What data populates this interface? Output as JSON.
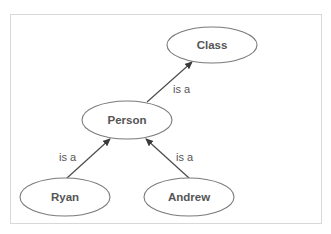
{
  "diagram": {
    "type": "class hierarchy",
    "colors": {
      "background": "#ffffff",
      "frame_border": "#d8d8d8",
      "node_stroke": "#7a7a7a",
      "node_text": "#555555",
      "edge": "#4a4a4a",
      "edge_text": "#555555"
    },
    "nodes": [
      {
        "id": "class",
        "label": "Class",
        "cx": 212,
        "cy": 45,
        "rx": 45,
        "ry": 18
      },
      {
        "id": "person",
        "label": "Person",
        "cx": 127,
        "cy": 120,
        "rx": 45,
        "ry": 19
      },
      {
        "id": "ryan",
        "label": "Ryan",
        "cx": 65,
        "cy": 197,
        "rx": 45,
        "ry": 19
      },
      {
        "id": "andrew",
        "label": "Andrew",
        "cx": 189,
        "cy": 197,
        "rx": 45,
        "ry": 19
      }
    ],
    "edges": [
      {
        "from": "person",
        "to": "class",
        "label": "is a",
        "x1": 147,
        "y1": 102,
        "x2": 192,
        "y2": 62,
        "lx": 173,
        "ly": 93
      },
      {
        "from": "ryan",
        "to": "person",
        "label": "is a",
        "x1": 67,
        "y1": 178,
        "x2": 110,
        "y2": 139,
        "lx": 59,
        "ly": 161
      },
      {
        "from": "andrew",
        "to": "person",
        "label": "is a",
        "x1": 189,
        "y1": 178,
        "x2": 146,
        "y2": 139,
        "lx": 176,
        "ly": 161
      }
    ]
  }
}
